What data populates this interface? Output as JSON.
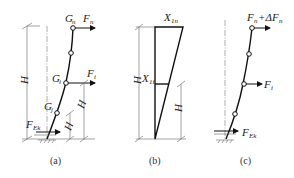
{
  "panels": [
    {
      "caption": "(a)",
      "labels": {
        "top_mass": "G",
        "top_mass_sub": "n",
        "top_force": "F",
        "top_force_sub": "n",
        "mid_mass": "G",
        "mid_mass_sub": "i",
        "mid_force": "F",
        "mid_force_sub": "i",
        "low_mass": "G",
        "low_mass_sub": "j",
        "base_force": "F",
        "base_force_sub": "Ek",
        "height": "H",
        "height_i": "H",
        "height_i_sub": "i",
        "height_j": "H",
        "height_j_sub": "j"
      }
    },
    {
      "caption": "(b)",
      "labels": {
        "top_value": "X",
        "top_value_sub": "1n",
        "mid_value": "X",
        "mid_value_sub": "1i",
        "height": "H",
        "height_i": "H",
        "height_i_sub": "i"
      }
    },
    {
      "caption": "(c)",
      "labels": {
        "top_force": "F",
        "top_force_sub": "n",
        "top_force_plus": "+ΔF",
        "top_force_plus_sub": "n",
        "mid_force": "F",
        "mid_force_sub": "i",
        "base_force": "F",
        "base_force_sub": "Ek"
      }
    }
  ]
}
